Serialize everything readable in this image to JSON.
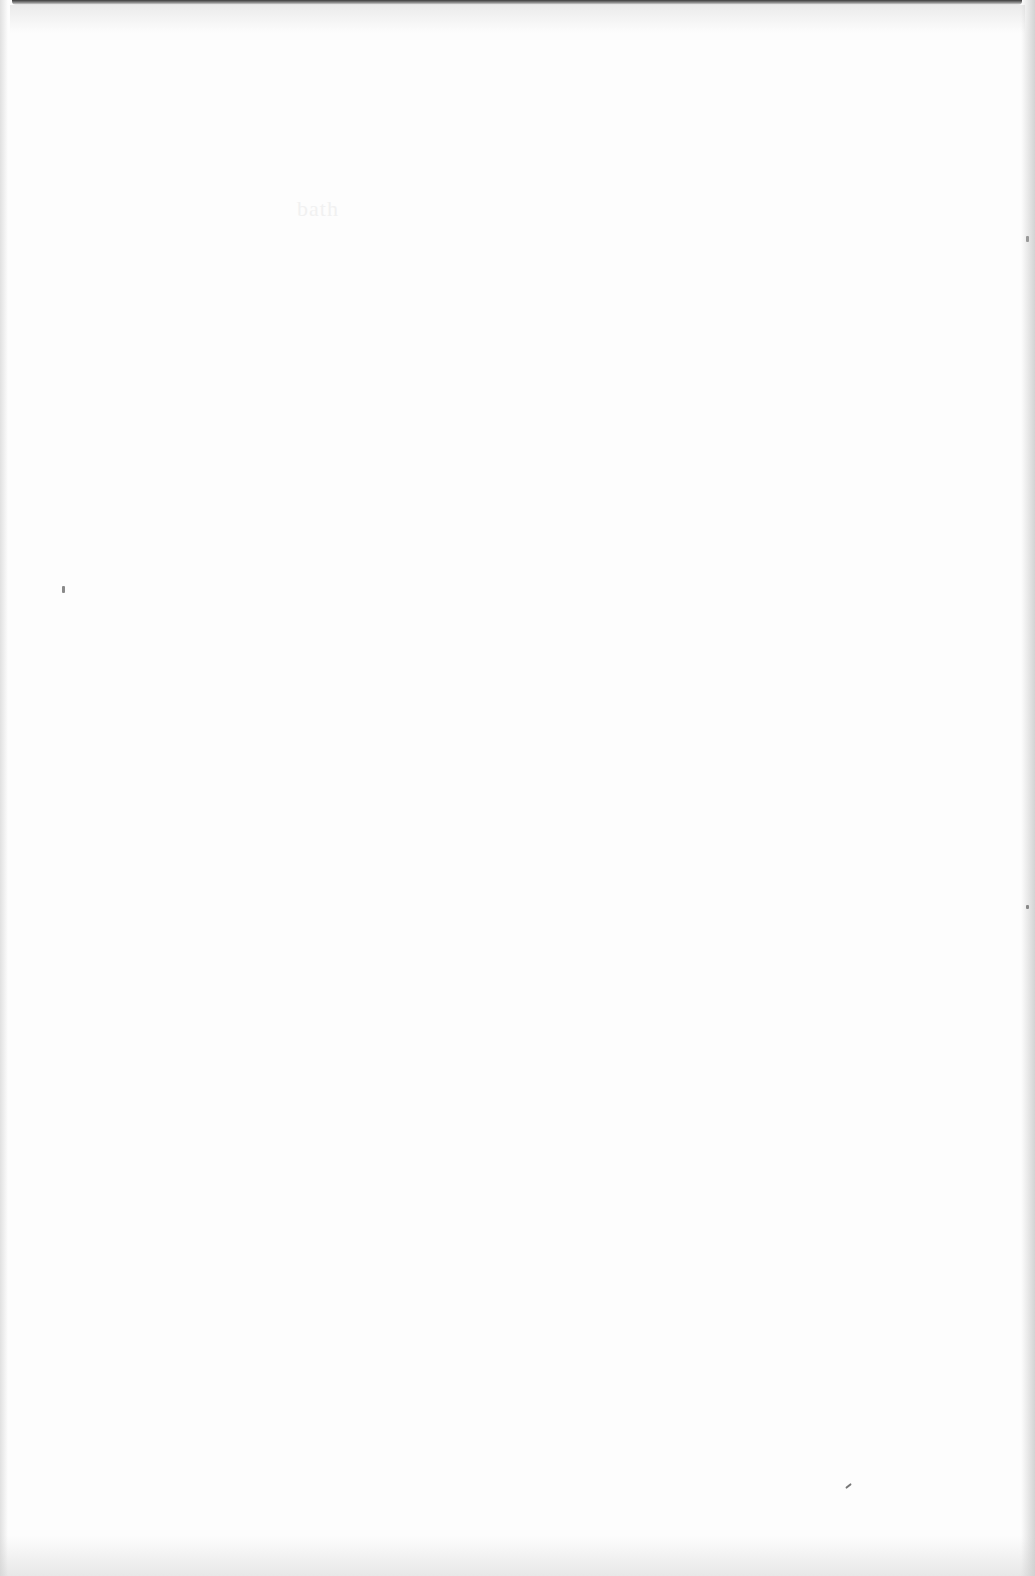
{
  "page": {
    "type": "blank-scanned-page",
    "faint_bleed_through_text": "bath",
    "background_color": "#fdfdfd"
  }
}
